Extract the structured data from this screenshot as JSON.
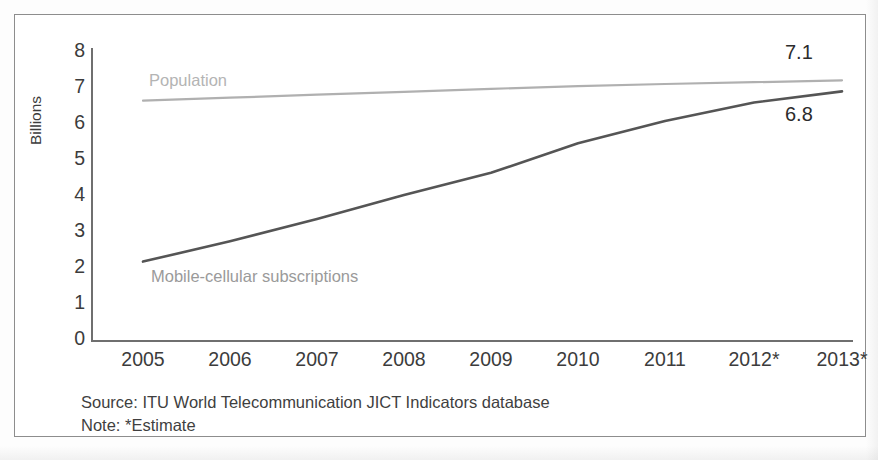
{
  "chart_data": {
    "type": "line",
    "title": "",
    "xlabel": "",
    "ylabel": "Billions",
    "ylim": [
      0,
      8
    ],
    "yticks": [
      8,
      7,
      6,
      5,
      4,
      3,
      2,
      1,
      0
    ],
    "grid": false,
    "legend_position": "inline-labels",
    "categories": [
      "2005",
      "2006",
      "2007",
      "2008",
      "2009",
      "2010",
      "2011",
      "2012*",
      "2013*"
    ],
    "series": [
      {
        "name": "Population",
        "color": "#b0b0b0",
        "values": [
          6.55,
          6.63,
          6.71,
          6.79,
          6.87,
          6.94,
          7.0,
          7.05,
          7.1
        ],
        "end_label": "7.1"
      },
      {
        "name": "Mobile-cellular subscriptions",
        "color": "#555555",
        "values": [
          2.2,
          2.75,
          3.35,
          4.0,
          4.6,
          5.4,
          6.0,
          6.5,
          6.8
        ],
        "end_label": "6.8"
      }
    ],
    "annotations": [
      {
        "text": "7.1",
        "series": "Population",
        "at": "2013*"
      },
      {
        "text": "6.8",
        "series": "Mobile-cellular subscriptions",
        "at": "2013*"
      }
    ]
  },
  "axis": {
    "y_title": "Billions",
    "y_ticks": [
      "8",
      "7",
      "6",
      "5",
      "4",
      "3",
      "2",
      "1",
      "0"
    ],
    "x_ticks": [
      "2005",
      "2006",
      "2007",
      "2008",
      "2009",
      "2010",
      "2011",
      "2012*",
      "2013*"
    ]
  },
  "series_labels": {
    "population": "Population",
    "mobile": "Mobile-cellular subscriptions"
  },
  "annotations": {
    "population_end": "7.1",
    "mobile_end": "6.8"
  },
  "footnotes": {
    "source": "Source: ITU World Telecommunication JICT Indicators database",
    "note": "Note: *Estimate"
  },
  "colors": {
    "population_line": "#b0b0b0",
    "mobile_line": "#555555",
    "axis": "#6f6f6f",
    "frame": "#8d8d8d",
    "text": "#3c3c3c"
  }
}
